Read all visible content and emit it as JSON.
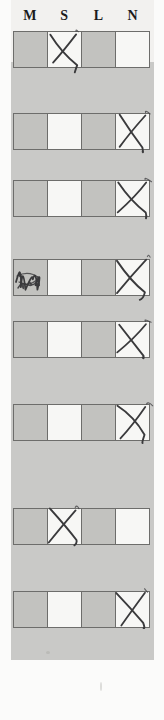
{
  "document": {
    "kind": "scanned-survey-form",
    "orientation": "portrait",
    "page_background": "#c9c9c7",
    "sheet_background": "#fbfbfa",
    "ink_color": "#3a3a3c",
    "rule_color": "#6d6d6b",
    "shaded_cell_color": "#c2c2bf",
    "open_cell_color": "#f7f7f5"
  },
  "header": {
    "columns": [
      {
        "id": "M",
        "label": "M"
      },
      {
        "id": "S",
        "label": "S"
      },
      {
        "id": "L",
        "label": "L"
      },
      {
        "id": "N",
        "label": "N"
      }
    ]
  },
  "grid": {
    "column_count": 4,
    "row_count": 8,
    "rows": [
      {
        "index": 1,
        "top": 31,
        "height": 37,
        "cells": [
          {
            "column": "M",
            "shaded": true,
            "mark": "none"
          },
          {
            "column": "S",
            "shaded": false,
            "mark": "x"
          },
          {
            "column": "L",
            "shaded": true,
            "mark": "none"
          },
          {
            "column": "N",
            "shaded": false,
            "mark": "none"
          }
        ]
      },
      {
        "index": 2,
        "top": 113,
        "height": 37,
        "cells": [
          {
            "column": "M",
            "shaded": true,
            "mark": "none"
          },
          {
            "column": "S",
            "shaded": false,
            "mark": "none"
          },
          {
            "column": "L",
            "shaded": true,
            "mark": "none"
          },
          {
            "column": "N",
            "shaded": false,
            "mark": "x"
          }
        ]
      },
      {
        "index": 3,
        "top": 180,
        "height": 37,
        "cells": [
          {
            "column": "M",
            "shaded": true,
            "mark": "none"
          },
          {
            "column": "S",
            "shaded": false,
            "mark": "none"
          },
          {
            "column": "L",
            "shaded": true,
            "mark": "none"
          },
          {
            "column": "N",
            "shaded": false,
            "mark": "x"
          }
        ]
      },
      {
        "index": 4,
        "top": 259,
        "height": 37,
        "cells": [
          {
            "column": "M",
            "shaded": true,
            "mark": "scribble"
          },
          {
            "column": "S",
            "shaded": false,
            "mark": "none"
          },
          {
            "column": "L",
            "shaded": true,
            "mark": "none"
          },
          {
            "column": "N",
            "shaded": false,
            "mark": "x"
          }
        ]
      },
      {
        "index": 5,
        "top": 321,
        "height": 37,
        "cells": [
          {
            "column": "M",
            "shaded": true,
            "mark": "none"
          },
          {
            "column": "S",
            "shaded": false,
            "mark": "none"
          },
          {
            "column": "L",
            "shaded": true,
            "mark": "none"
          },
          {
            "column": "N",
            "shaded": false,
            "mark": "x"
          }
        ]
      },
      {
        "index": 6,
        "top": 404,
        "height": 37,
        "cells": [
          {
            "column": "M",
            "shaded": true,
            "mark": "none"
          },
          {
            "column": "S",
            "shaded": false,
            "mark": "none"
          },
          {
            "column": "L",
            "shaded": true,
            "mark": "none"
          },
          {
            "column": "N",
            "shaded": false,
            "mark": "x"
          }
        ]
      },
      {
        "index": 7,
        "top": 508,
        "height": 37,
        "cells": [
          {
            "column": "M",
            "shaded": true,
            "mark": "none"
          },
          {
            "column": "S",
            "shaded": false,
            "mark": "x"
          },
          {
            "column": "L",
            "shaded": true,
            "mark": "none"
          },
          {
            "column": "N",
            "shaded": false,
            "mark": "none"
          }
        ]
      },
      {
        "index": 8,
        "top": 591,
        "height": 37,
        "cells": [
          {
            "column": "M",
            "shaded": true,
            "mark": "none"
          },
          {
            "column": "S",
            "shaded": false,
            "mark": "none"
          },
          {
            "column": "L",
            "shaded": true,
            "mark": "none"
          },
          {
            "column": "N",
            "shaded": false,
            "mark": "x"
          }
        ]
      }
    ]
  }
}
